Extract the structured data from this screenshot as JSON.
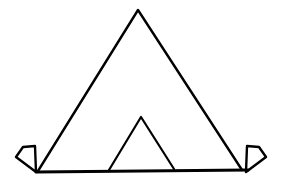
{
  "figure": {
    "title": "Tent line drawing",
    "background_color": "#ffffff",
    "stroke_color": "#000000",
    "canvas": {
      "width": 283,
      "height": 186
    },
    "parts": [
      {
        "name": "main-tent-triangle",
        "label": "Main tent body"
      },
      {
        "name": "inner-door-triangle",
        "label": "Tent doorway"
      },
      {
        "name": "ground-line",
        "label": "Ground line"
      },
      {
        "name": "left-peg",
        "label": "Left peg"
      },
      {
        "name": "right-peg",
        "label": "Right peg"
      }
    ]
  },
  "chart_data": {
    "type": "line",
    "title": "Tent line drawing",
    "xlabel": "",
    "ylabel": "",
    "xlim": [
      0,
      283
    ],
    "ylim": [
      0,
      186
    ],
    "grid": false,
    "legend": "none",
    "stroke_color": "#000000",
    "background": "#ffffff",
    "series": [
      {
        "name": "main-tent-triangle",
        "stroke_width": 2.4,
        "closed": false,
        "points": [
          [
            38,
            171
          ],
          [
            138,
            10
          ],
          [
            242,
            170
          ]
        ]
      },
      {
        "name": "inner-door-triangle",
        "stroke_width": 2.2,
        "closed": false,
        "points": [
          [
            109,
            170
          ],
          [
            141,
            117
          ],
          [
            174,
            169
          ]
        ]
      },
      {
        "name": "ground-line",
        "stroke_width": 3.0,
        "closed": false,
        "points": [
          [
            36,
            172
          ],
          [
            248,
            170
          ]
        ]
      },
      {
        "name": "left-peg",
        "stroke_width": 2.4,
        "closed": true,
        "points": [
          [
            36,
            172
          ],
          [
            16,
            157
          ],
          [
            23,
            147
          ],
          [
            35,
            146
          ]
        ]
      },
      {
        "name": "right-peg",
        "stroke_width": 2.4,
        "closed": true,
        "points": [
          [
            246,
            172
          ],
          [
            266,
            157
          ],
          [
            259,
            147
          ],
          [
            247,
            146
          ]
        ]
      }
    ]
  }
}
